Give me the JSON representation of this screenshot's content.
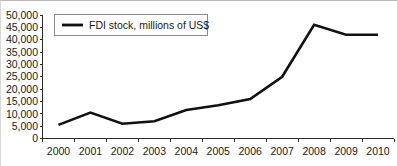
{
  "chart_data": {
    "type": "line",
    "title": "",
    "xlabel": "",
    "ylabel": "",
    "grid": false,
    "legend_position": "top-left",
    "categories": [
      "2000",
      "2001",
      "2002",
      "2003",
      "2004",
      "2005",
      "2006",
      "2007",
      "2008",
      "2009",
      "2010"
    ],
    "x": [
      2000,
      2001,
      2002,
      2003,
      2004,
      2005,
      2006,
      2007,
      2008,
      2009,
      2010
    ],
    "series": [
      {
        "name": "FDI stock, millions of US$",
        "color": "#111111",
        "values": [
          5500,
          10500,
          6000,
          7000,
          11500,
          13500,
          16000,
          25000,
          46000,
          42000,
          42000
        ]
      }
    ],
    "ylim": [
      0,
      50000
    ],
    "yticks": [
      0,
      5000,
      10000,
      15000,
      20000,
      25000,
      30000,
      35000,
      40000,
      45000,
      50000
    ],
    "ytick_labels": [
      "0",
      "5,000",
      "10,000",
      "15,000",
      "20,000",
      "25,000",
      "30,000",
      "35,000",
      "40,000",
      "45,000",
      "50,000"
    ],
    "xtick_labels": [
      "2000",
      "2001",
      "2002",
      "2003",
      "2004",
      "2005",
      "2006",
      "2007",
      "2008",
      "2009",
      "2010"
    ]
  },
  "legend": {
    "entries": [
      {
        "label": "FDI stock, millions of US$",
        "color": "#111111"
      }
    ]
  },
  "colors": {
    "series": "#111111",
    "axis": "#2b2b2b",
    "text": "#1a1a1a",
    "legend_border": "#8a8a8a",
    "background": "#ffffff"
  }
}
